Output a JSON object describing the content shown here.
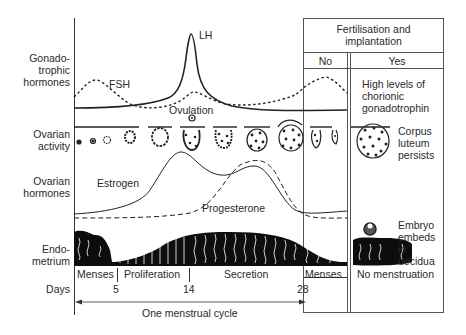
{
  "diagram": {
    "row_labels": {
      "gonadotrophic": [
        "Gonado-",
        "trophic",
        "hormones"
      ],
      "ovarian_activity": [
        "Ovarian",
        "activity"
      ],
      "ovarian_hormones": [
        "Ovarian",
        "hormones"
      ],
      "endometrium": [
        "Endo-",
        "metrium"
      ],
      "days": "Days"
    },
    "curve_labels": {
      "lh": "LH",
      "fsh": "FSH",
      "ovulation": "Ovulation",
      "estrogen": "Estrogen",
      "progesterone": "Progesterone"
    },
    "phases": {
      "menses": "Menses",
      "proliferation": "Proliferation",
      "secretion": "Secretion",
      "menses_no": "Menses",
      "no_menstruation": "No menstruation"
    },
    "day_ticks": [
      "5",
      "14",
      "28"
    ],
    "cycle_label": "One menstrual cycle",
    "fertilisation_box": {
      "header": [
        "Fertilisation and",
        "implantation"
      ],
      "no": "No",
      "yes": "Yes",
      "yes_hormone_note": [
        "High levels of",
        "chorionic",
        "gonadotrophin"
      ],
      "yes_ovary_note": [
        "Corpus",
        "luteum",
        "persists"
      ],
      "yes_endometrium_note": [
        "Embryo",
        "embeds",
        "in",
        "decidua"
      ]
    }
  }
}
